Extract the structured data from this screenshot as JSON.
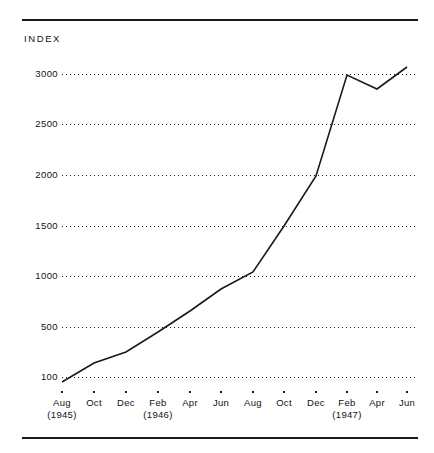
{
  "figure": {
    "axis_label": "INDEX",
    "rules": [
      "top-rule",
      "bottom-rule"
    ],
    "line_color": "#1a1a1a",
    "grid_color": "#1a1a1a",
    "background": "#ffffff"
  },
  "chart_data": {
    "type": "line",
    "title": "",
    "subtitle": "",
    "xlabel": "",
    "ylabel": "INDEX",
    "grid": true,
    "legend": "none",
    "ylim": [
      100,
      3200
    ],
    "ytick_labels": [
      "3000",
      "2500",
      "2000",
      "1500",
      "1000",
      "500",
      "100"
    ],
    "ytick_values": [
      3000,
      2500,
      2000,
      1500,
      1000,
      500,
      100
    ],
    "categories": [
      "Aug",
      "Oct",
      "Dec",
      "Feb",
      "Apr",
      "Jun",
      "Aug",
      "Oct",
      "Dec",
      "Feb",
      "Apr",
      "Jun"
    ],
    "category_years": [
      "(1945)",
      "",
      "",
      "(1946)",
      "",
      "",
      "",
      "",
      "",
      "(1947)",
      "",
      ""
    ],
    "series": [
      {
        "name": "Index",
        "values": [
          100,
          230,
          290,
          500,
          700,
          900,
          1100,
          1500,
          2500,
          3000,
          2870,
          3060
        ]
      }
    ]
  },
  "ylabels": [
    {
      "text": "3000",
      "top": 69
    },
    {
      "text": "2500",
      "top": 119
    },
    {
      "text": "2000",
      "top": 170
    },
    {
      "text": "1500",
      "top": 221
    },
    {
      "text": "1000",
      "top": 271
    },
    {
      "text": "500",
      "top": 322
    },
    {
      "text": "100",
      "top": 372
    }
  ],
  "gridlines": [
    {
      "top": 74
    },
    {
      "top": 124
    },
    {
      "top": 175
    },
    {
      "top": 226
    },
    {
      "top": 276
    },
    {
      "top": 327
    },
    {
      "top": 377
    }
  ],
  "xticks": [
    {
      "label": "Aug",
      "year": "(1945)",
      "x": 62
    },
    {
      "label": "Oct",
      "year": "",
      "x": 94
    },
    {
      "label": "Dec",
      "year": "",
      "x": 126
    },
    {
      "label": "Feb",
      "year": "(1946)",
      "x": 158
    },
    {
      "label": "Apr",
      "year": "",
      "x": 190
    },
    {
      "label": "Jun",
      "year": "",
      "x": 221
    },
    {
      "label": "Aug",
      "year": "",
      "x": 253
    },
    {
      "label": "Oct",
      "year": "",
      "x": 284
    },
    {
      "label": "Dec",
      "year": "",
      "x": 316
    },
    {
      "label": "Feb",
      "year": "(1947)",
      "x": 347
    },
    {
      "label": "Apr",
      "year": "",
      "x": 377
    },
    {
      "label": "Jun",
      "year": "",
      "x": 407
    }
  ],
  "polyline_points": "62,382 94,363 126,352 158,332 190,311 221,289 253,272 284,226 316,176 347,75 377,89 407,67"
}
